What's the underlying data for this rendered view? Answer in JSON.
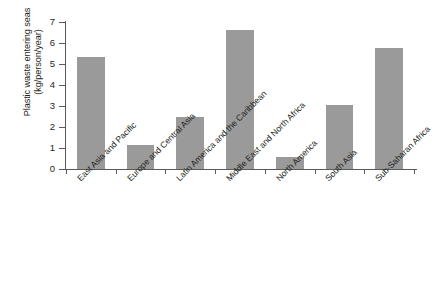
{
  "chart_data": {
    "type": "bar",
    "title": "",
    "subtitle": "",
    "xlabel": "",
    "ylabel": "Plastic waste entering seas (kg/person/year)",
    "ylabel_line1": "Plastic waste entering seas",
    "ylabel_line2": "(kg/person/year)",
    "categories": [
      "East Asia and Pacific",
      "Europe and Central Asia",
      "Latin America and the Caribbean",
      "Middle East and North Africa",
      "North America",
      "South Asia",
      "Sub-Saharan Africa"
    ],
    "values": [
      5.35,
      1.15,
      2.5,
      6.6,
      0.57,
      3.05,
      5.75
    ],
    "ylim": [
      0,
      7
    ],
    "yticks": [
      0,
      1,
      2,
      3,
      4,
      5,
      6,
      7
    ],
    "ytick_labels": [
      "0",
      "1",
      "2",
      "3",
      "4",
      "5",
      "6",
      "7"
    ],
    "grid": false,
    "legend": null,
    "legend_position": "none",
    "bar_color": "#9a9a9a",
    "axis_color": "#5a5a5a",
    "text_color": "#231f20",
    "background_color": "#ffffff",
    "label_rotation_degrees": -45
  }
}
